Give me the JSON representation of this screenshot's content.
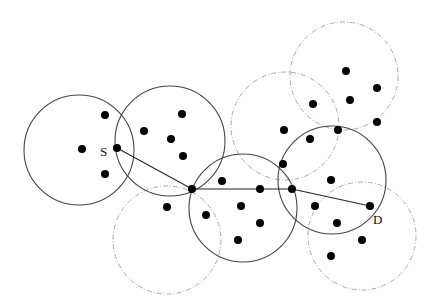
{
  "diagram": {
    "type": "wireless network routing diagram",
    "labels": {
      "source": "S",
      "destination": "D"
    },
    "colors": {
      "solid_circle": "#444444",
      "dashed_circle": "#aaaaaa",
      "node": "#000000",
      "path": "#222222"
    },
    "solid_ranges": [
      {
        "cx": 79,
        "cy": 150,
        "r": 55
      },
      {
        "cx": 170,
        "cy": 141,
        "r": 55
      },
      {
        "cx": 243,
        "cy": 208,
        "r": 54
      },
      {
        "cx": 332,
        "cy": 180,
        "r": 54
      }
    ],
    "dashed_ranges": [
      {
        "cx": 344,
        "cy": 76,
        "r": 54
      },
      {
        "cx": 285,
        "cy": 126,
        "r": 54
      },
      {
        "cx": 167,
        "cy": 240,
        "r": 54
      },
      {
        "cx": 362,
        "cy": 236,
        "r": 54
      }
    ],
    "nodes": [
      {
        "x": 82,
        "y": 149
      },
      {
        "x": 105,
        "y": 115
      },
      {
        "x": 105,
        "y": 174
      },
      {
        "x": 117,
        "y": 148
      },
      {
        "x": 144,
        "y": 131
      },
      {
        "x": 182,
        "y": 114
      },
      {
        "x": 171,
        "y": 139
      },
      {
        "x": 183,
        "y": 156
      },
      {
        "x": 192,
        "y": 189
      },
      {
        "x": 222,
        "y": 181
      },
      {
        "x": 167,
        "y": 207
      },
      {
        "x": 206,
        "y": 215
      },
      {
        "x": 241,
        "y": 206
      },
      {
        "x": 260,
        "y": 223
      },
      {
        "x": 238,
        "y": 240
      },
      {
        "x": 260,
        "y": 189
      },
      {
        "x": 283,
        "y": 164
      },
      {
        "x": 292,
        "y": 189
      },
      {
        "x": 284,
        "y": 130
      },
      {
        "x": 313,
        "y": 104
      },
      {
        "x": 346,
        "y": 71
      },
      {
        "x": 377,
        "y": 88
      },
      {
        "x": 350,
        "y": 100
      },
      {
        "x": 377,
        "y": 122
      },
      {
        "x": 338,
        "y": 130
      },
      {
        "x": 310,
        "y": 139
      },
      {
        "x": 331,
        "y": 180
      },
      {
        "x": 315,
        "y": 206
      },
      {
        "x": 337,
        "y": 223
      },
      {
        "x": 370,
        "y": 206
      },
      {
        "x": 362,
        "y": 240
      },
      {
        "x": 331,
        "y": 256
      }
    ],
    "route": [
      {
        "x": 117,
        "y": 148
      },
      {
        "x": 192,
        "y": 189
      },
      {
        "x": 292,
        "y": 189
      },
      {
        "x": 370,
        "y": 206
      }
    ],
    "label_positions": {
      "source": {
        "x": 100,
        "y": 156
      },
      "destination": {
        "x": 373,
        "y": 224
      }
    }
  }
}
